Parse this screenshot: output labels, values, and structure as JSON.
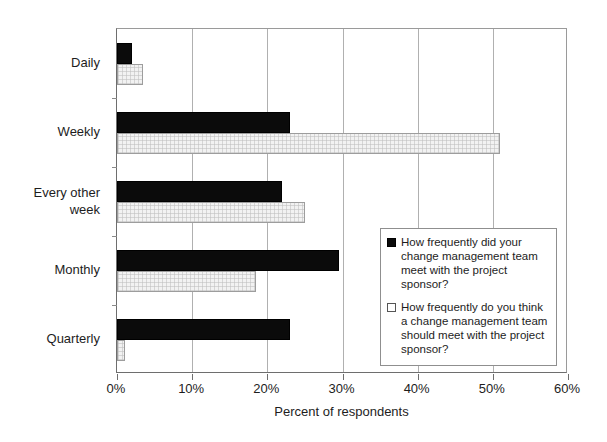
{
  "chart_data": {
    "type": "bar",
    "orientation": "horizontal",
    "title": "",
    "xlabel": "Percent of respondents",
    "ylabel": "",
    "xlim": [
      0,
      60
    ],
    "xtick_labels": [
      "0%",
      "10%",
      "20%",
      "30%",
      "40%",
      "50%",
      "60%"
    ],
    "xtick_values": [
      0,
      10,
      20,
      30,
      40,
      50,
      60
    ],
    "grid": true,
    "grid_axis": "x",
    "legend_position": "inside-right",
    "categories": [
      "Daily",
      "Weekly",
      "Every other week",
      "Monthly",
      "Quarterly"
    ],
    "series": [
      {
        "name": "How frequently did your change management team meet with the project sponsor?",
        "fill": "black",
        "values": [
          2,
          23,
          22,
          29.5,
          23
        ]
      },
      {
        "name": "How frequently do you think a change management team should meet with the project sponsor?",
        "fill": "light-gray-pattern",
        "values": [
          3.5,
          51,
          25,
          18.5,
          1
        ]
      }
    ]
  },
  "legend": {
    "items": [
      {
        "swatch": "dark",
        "label": "How frequently did your change management team meet with the project sponsor?"
      },
      {
        "swatch": "light",
        "label": "How frequently do you think a change management team should meet with the project sponsor?"
      }
    ]
  },
  "colors": {
    "series_1": "#0b0b0b",
    "series_2": "#f2f2f2",
    "axis": "#6e6e6e",
    "gridline": "#b0b0b0",
    "text": "#1d1d1d",
    "background": "#ffffff"
  }
}
